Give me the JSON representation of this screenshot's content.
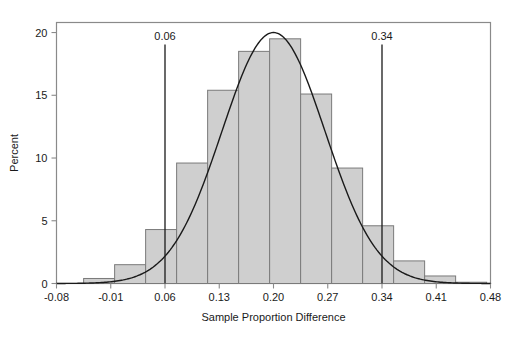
{
  "chart_data": {
    "type": "bar",
    "title": "",
    "subtitle": "",
    "xlabel": "Sample Proportion Difference",
    "ylabel": "Percent",
    "xlim": [
      -0.08,
      0.48
    ],
    "ylim": [
      0,
      20.8
    ],
    "grid": false,
    "legend": null,
    "x_tick_labels": [
      "-0.08",
      "-0.01",
      "0.06",
      "0.13",
      "0.20",
      "0.27",
      "0.34",
      "0.41",
      "0.48"
    ],
    "x_tick_values": [
      -0.08,
      -0.01,
      0.06,
      0.13,
      0.2,
      0.27,
      0.34,
      0.41,
      0.48
    ],
    "y_tick_labels": [
      "0",
      "5",
      "10",
      "15",
      "20"
    ],
    "y_tick_values": [
      0,
      5,
      10,
      15,
      20
    ],
    "bin_width": 0.04,
    "bin_left_edges": [
      -0.045,
      -0.005,
      0.035,
      0.075,
      0.115,
      0.155,
      0.195,
      0.235,
      0.275,
      0.315,
      0.355,
      0.395,
      0.435
    ],
    "categories": [
      "-0.045",
      "-0.005",
      "0.035",
      "0.075",
      "0.115",
      "0.155",
      "0.195",
      "0.235",
      "0.275",
      "0.315",
      "0.355",
      "0.395",
      "0.435"
    ],
    "values": [
      0.4,
      1.5,
      4.3,
      9.6,
      15.4,
      18.5,
      19.5,
      15.1,
      9.2,
      4.6,
      1.8,
      0.6,
      0.1
    ],
    "series": [
      {
        "name": "Percent",
        "values": [
          0.4,
          1.5,
          4.3,
          9.6,
          15.4,
          18.5,
          19.5,
          15.1,
          9.2,
          4.6,
          1.8,
          0.6,
          0.1
        ]
      }
    ],
    "overlay_curve": {
      "name": "normal-density-curve",
      "type": "line",
      "mean": 0.2,
      "sd": 0.0665,
      "peak_value": 20.0
    },
    "reference_lines": [
      {
        "name": "lower-reference-line",
        "value": 0.06,
        "label": "0.06"
      },
      {
        "name": "upper-reference-line",
        "value": 0.34,
        "label": "0.34"
      }
    ],
    "colors": {
      "bar_fill": "#cfcfcf",
      "bar_stroke": "#7a7a7a",
      "curve": "#1a1a1a",
      "axis": "#8a8a8a",
      "reference_line": "#1a1a1a",
      "text": "#1a1a1a",
      "background": "#ffffff"
    }
  },
  "axes": {
    "y_title": "Percent",
    "x_title": "Sample Proportion Difference"
  }
}
